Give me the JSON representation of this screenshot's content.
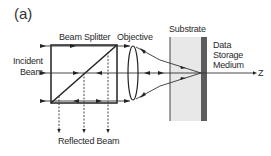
{
  "panel_label": "(a)",
  "labels": {
    "beam_splitter": "Beam Splitter",
    "objective": "Objective",
    "substrate": "Substrate",
    "incident_beam_line1": "Incident",
    "incident_beam_line2": "Beam",
    "data_storage_line1": "Data",
    "data_storage_line2": "Storage",
    "data_storage_line3": "Medium",
    "reflected_beam": "Reflected Beam",
    "z_axis": "Z"
  },
  "colors": {
    "line": "#222222",
    "substrate_fill": "#e6e6e6",
    "medium_fill": "#5a5a5a"
  }
}
